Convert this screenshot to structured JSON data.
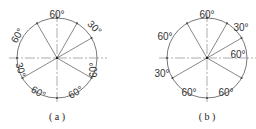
{
  "figures": [
    {
      "id": "a",
      "caption": "( a )",
      "center": [
        57,
        58
      ],
      "radius": 40,
      "radial_angles_deg": [
        120,
        60,
        30,
        -30,
        210
      ],
      "arc_labels": [
        {
          "text": "60°",
          "from": 60,
          "to": 120,
          "x": 57,
          "y": 15,
          "rotate": 0
        },
        {
          "text": "30°",
          "from": 30,
          "to": 60,
          "x": 94,
          "y": 28,
          "rotate": 45
        },
        {
          "text": "60°",
          "from": -30,
          "to": 30,
          "x": 94,
          "y": 70,
          "rotate": -90
        },
        {
          "text": "60°",
          "from": -90,
          "to": -30,
          "x": 76,
          "y": 93,
          "rotate": -30
        },
        {
          "text": "60°",
          "from": -150,
          "to": -90,
          "x": 38,
          "y": 93,
          "rotate": 30
        },
        {
          "text": "30°",
          "from": 180,
          "to": 210,
          "x": 20,
          "y": 70,
          "rotate": 75
        },
        {
          "text": "60°",
          "from": 120,
          "to": 180,
          "x": 18,
          "y": 36,
          "rotate": -60
        }
      ]
    },
    {
      "id": "b",
      "caption": "( b )",
      "center": [
        207,
        58
      ],
      "radius": 40,
      "radial_angles_deg": [
        120,
        60,
        30,
        -30,
        210
      ],
      "arc_labels": [
        {
          "text": "60°",
          "from": 60,
          "to": 120,
          "x": 207,
          "y": 15,
          "rotate": 0
        },
        {
          "text": "30°",
          "from": 30,
          "to": 60,
          "x": 241,
          "y": 28,
          "rotate": 0
        },
        {
          "text": "60°",
          "from": -30,
          "to": 30,
          "x": 238,
          "y": 55,
          "rotate": 0
        },
        {
          "text": "60°",
          "from": -90,
          "to": -30,
          "x": 226,
          "y": 93,
          "rotate": 0
        },
        {
          "text": "60°",
          "from": -150,
          "to": -90,
          "x": 189,
          "y": 93,
          "rotate": 0
        },
        {
          "text": "30°",
          "from": 180,
          "to": 210,
          "x": 162,
          "y": 74,
          "rotate": 0
        },
        {
          "text": "60°",
          "from": 120,
          "to": 180,
          "x": 165,
          "y": 37,
          "rotate": 0
        }
      ]
    }
  ],
  "colors": {
    "line": "#555555",
    "centerline": "#777777",
    "text": "#333333"
  }
}
